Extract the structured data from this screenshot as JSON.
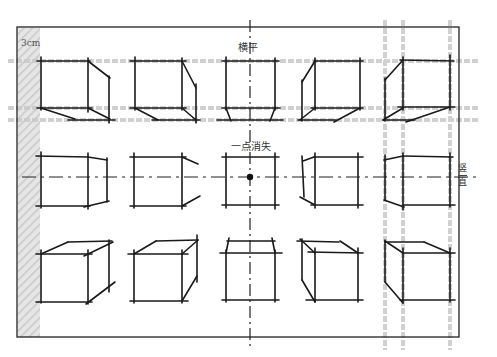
{
  "diagram": {
    "type": "one-point perspective cube study",
    "labels": {
      "scale": "3cm",
      "horizontal": "横平",
      "vanishing_point": "一点消失",
      "vertical_top": "竖",
      "vertical_bottom": "直"
    },
    "colors": {
      "ink": "#1a1a1a",
      "guide": "#cfcfcf",
      "hatch": "#d9d9d9",
      "frame": "#222222"
    },
    "grid": {
      "rows": 3,
      "cols": 5,
      "center_point": [
        250,
        177
      ]
    }
  }
}
